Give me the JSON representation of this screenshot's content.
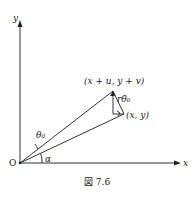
{
  "figure": {
    "caption": "図 7.6",
    "labels": {
      "y_axis": "y",
      "x_axis": "x",
      "origin": "O",
      "point_top": "(x + u, y + v)",
      "point_bottom": "(x, y)",
      "segment": "rθ̇₀",
      "angle_theta": "θ₀",
      "angle_alpha": "α"
    }
  }
}
